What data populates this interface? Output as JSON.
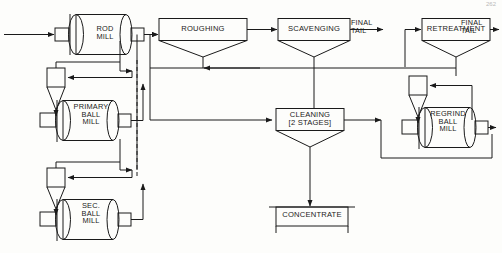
{
  "diagram": {
    "page_marker": "262",
    "line_color": "#1a1a1a",
    "background": "#fdfdfb"
  },
  "mills": [
    {
      "id": "rod-mill",
      "label": "ROD\nMILL",
      "lines": [
        "ROD",
        "MILL"
      ]
    },
    {
      "id": "primary-ball-mill",
      "label": "PRIMARY\nBALL\nMILL",
      "lines": [
        "PRIMARY",
        "BALL",
        "MILL"
      ]
    },
    {
      "id": "secondary-ball-mill",
      "label": "SEC.\nBALL\nMILL",
      "lines": [
        "SEC.",
        "BALL",
        "MILL"
      ]
    },
    {
      "id": "regrind-ball-mill",
      "label": "REGRIND\nBALL\nMILL",
      "lines": [
        "REGRIND",
        "BALL",
        "MILL"
      ]
    }
  ],
  "flotation_cells": [
    {
      "id": "roughing",
      "label": "ROUGHING"
    },
    {
      "id": "scavenging",
      "label": "SCAVENGING"
    },
    {
      "id": "retreatment",
      "label": "RETREATMENT"
    },
    {
      "id": "cleaning",
      "label": "CLEANING\n[2 STAGES]",
      "line1": "CLEANING",
      "line2": "[2 STAGES]"
    }
  ],
  "streams": [
    {
      "id": "scavenging-final-tail",
      "label": "FINAL\nTAIL",
      "line1": "FINAL",
      "line2": "TAIL"
    },
    {
      "id": "retreatment-final-tail",
      "label": "FINAL\nTAIL",
      "line1": "FINAL",
      "line2": "TAIL"
    }
  ],
  "product": {
    "id": "concentrate",
    "label": "CONCENTRATE"
  },
  "cyclones": [
    {
      "id": "primary-cyclone"
    },
    {
      "id": "secondary-cyclone"
    },
    {
      "id": "regrind-cyclone"
    }
  ]
}
